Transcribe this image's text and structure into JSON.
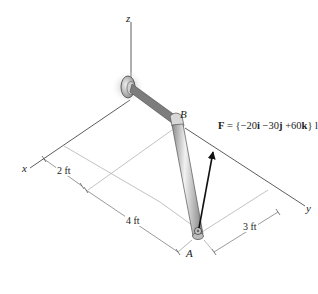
{
  "diagram": {
    "axes": {
      "z": "z",
      "x": "x",
      "y": "y"
    },
    "points": {
      "A": "A",
      "B": "B"
    },
    "dimensions": {
      "d1": "2 ft",
      "d2": "4 ft",
      "d3": "3 ft"
    },
    "force": {
      "symbol": "F",
      "equals": "=",
      "open": "{",
      "i_coef": "−20",
      "i": "i",
      "j_coef": "−30",
      "j": "j",
      "k_coef": "+60",
      "k": "k",
      "close": "}",
      "unit": "lb"
    },
    "colors": {
      "axis": "#333333",
      "dimension": "#9a9a9a",
      "pipe_light": "#e6e6e6",
      "pipe_dark": "#8a8a8a",
      "arrow": "#111111"
    }
  }
}
